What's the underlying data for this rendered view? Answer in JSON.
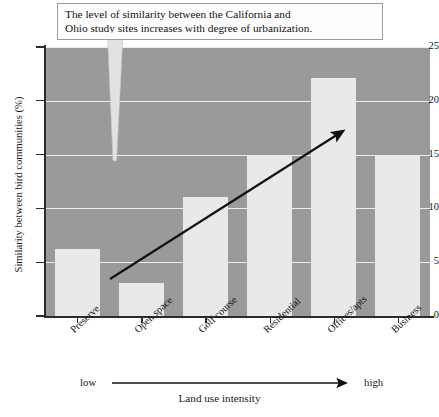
{
  "annotation": {
    "line1": "The level of similarity between the California and",
    "line2": "Ohio study sites increases with degree of urbanization."
  },
  "axes": {
    "y_title": "Similarity between bird communities (%)",
    "x_title": "Land use intensity",
    "x_low_label": "low",
    "x_high_label": "high",
    "y_ticks": [
      "0",
      "5",
      "10",
      "15",
      "20",
      "25"
    ]
  },
  "caption": "",
  "colors": {
    "plot_background": "#9a9a9a",
    "bar_fill": "#e9e9e9",
    "gridline": "#ededed",
    "axis": "#2b2b2b",
    "trend_arrow": "#111111",
    "callout_fill": "#e0e0e0",
    "annotation_bg": "#fdfdfd",
    "annotation_border": "#9b9b9b"
  },
  "chart_data": {
    "type": "bar",
    "title": "",
    "categories": [
      "Preserve",
      "Open space",
      "Golf course",
      "Residential",
      "Offices/apts",
      "Business"
    ],
    "values": [
      6.2,
      3.1,
      11.1,
      15.0,
      22.1,
      15.0
    ],
    "xlabel": "Land use intensity",
    "ylabel": "Similarity between bird communities (%)",
    "ylim": [
      0,
      25
    ],
    "yticks": [
      0,
      5,
      10,
      15,
      20,
      25
    ],
    "grid": true,
    "legend": "none",
    "annotations": [
      {
        "text": "The level of similarity between the California and Ohio study sites increases with degree of urbanization.",
        "type": "callout-box"
      },
      {
        "text": "low → high",
        "type": "axis-direction-arrow"
      },
      {
        "text": "",
        "type": "trend-arrow-upward"
      }
    ]
  }
}
